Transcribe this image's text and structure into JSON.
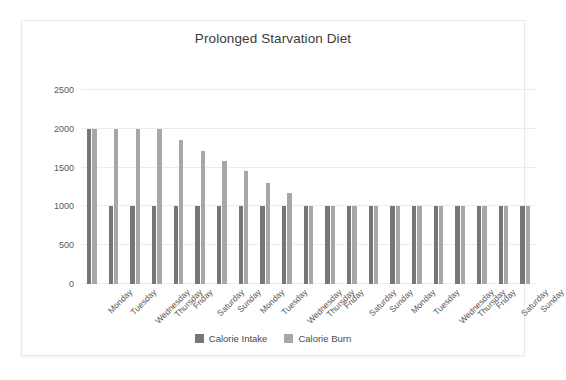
{
  "chart_data": {
    "type": "bar",
    "title": "Prolonged Starvation Diet",
    "xlabel": "",
    "ylabel": "",
    "ylim": [
      0,
      2500
    ],
    "yticks": [
      0,
      500,
      1000,
      1500,
      2000,
      2500
    ],
    "ytick_labels": [
      "0",
      "500",
      "1000",
      "1500",
      "2000",
      "2500"
    ],
    "grid": true,
    "legend_position": "bottom",
    "categories": [
      "Monday",
      "Tuesday",
      "Wednesday",
      "Thursday",
      "Friday",
      "Saturday",
      "Sunday",
      "Monday",
      "Tuesday",
      "Wednesday",
      "Thursday",
      "Friday",
      "Saturday",
      "Sunday",
      "Monday",
      "Tuesday",
      "Wednesday",
      "Thursday",
      "Friday",
      "Saturday",
      "Sunday"
    ],
    "series": [
      {
        "name": "Calorie Intake",
        "color": "#767676",
        "values": [
          2000,
          1000,
          1000,
          1000,
          1000,
          1000,
          1000,
          1000,
          1000,
          1000,
          1000,
          1000,
          1000,
          1000,
          1000,
          1000,
          1000,
          1000,
          1000,
          1000,
          1000
        ]
      },
      {
        "name": "Calorie Burn",
        "color": "#a7a7a7",
        "values": [
          2000,
          2000,
          2000,
          2000,
          1860,
          1720,
          1580,
          1450,
          1300,
          1170,
          1000,
          1000,
          1000,
          1000,
          1000,
          1000,
          1000,
          1000,
          1000,
          1000,
          1000
        ]
      }
    ]
  }
}
